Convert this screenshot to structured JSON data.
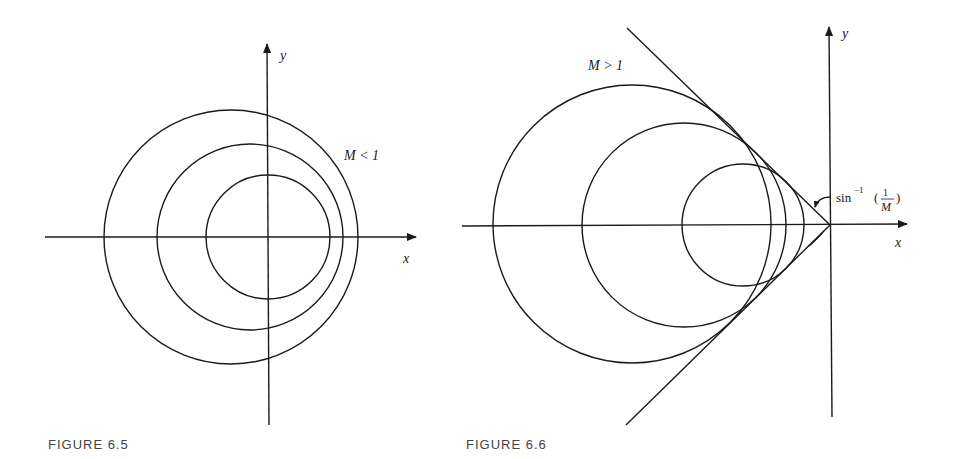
{
  "figures": [
    {
      "caption": "FIGURE 6.5",
      "condition_label": "M < 1",
      "axes": {
        "x_label": "x",
        "y_label": "y"
      },
      "circles": [
        {
          "cx": 231,
          "cy": 237,
          "r": 127
        },
        {
          "cx": 250,
          "cy": 237,
          "r": 93
        },
        {
          "cx": 268,
          "cy": 237,
          "r": 62
        }
      ]
    },
    {
      "caption": "FIGURE 6.6",
      "condition_label": "M > 1",
      "axes": {
        "x_label": "x",
        "y_label": "y"
      },
      "angle_label": {
        "prefix": "sin",
        "superscript": "−1",
        "numerator": "1",
        "denominator": "M"
      },
      "circles": [
        {
          "cx": 632,
          "cy": 224,
          "r": 139
        },
        {
          "cx": 684,
          "cy": 225,
          "r": 102
        },
        {
          "cx": 743,
          "cy": 225,
          "r": 61
        }
      ]
    }
  ]
}
